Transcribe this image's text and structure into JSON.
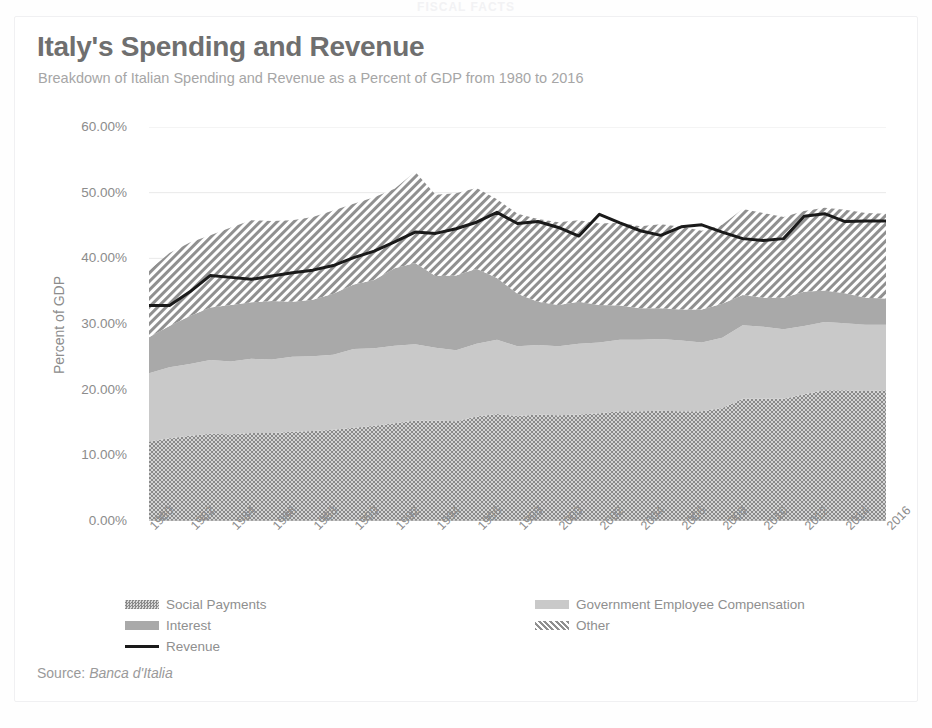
{
  "top_clip_text": "FISCAL FACTS",
  "card": {
    "title": "Italy's Spending and Revenue",
    "subtitle": "Breakdown of Italian Spending and Revenue as a Percent of GDP from 1980 to 2016",
    "source_prefix": "Source:",
    "source_name": "Banca d'Italia"
  },
  "legend": {
    "items": [
      {
        "label": "Social Payments",
        "marker": "pattern-dots-dark",
        "color": "#878787"
      },
      {
        "label": "Government Employee Compensation",
        "marker": "solid-lightgray",
        "color": "#c9c9c9"
      },
      {
        "label": "Interest",
        "marker": "solid-gray",
        "color": "#a9a9a9"
      },
      {
        "label": "Other",
        "marker": "pattern-diagonal",
        "color": "#9e9e9e"
      },
      {
        "label": "Revenue",
        "marker": "line-black",
        "color": "#1a1a1a"
      }
    ]
  },
  "chart_data": {
    "type": "area",
    "stacked": true,
    "title": "Italy's Spending and Revenue",
    "subtitle": "Breakdown of Italian Spending and Revenue as a Percent of GDP from 1980 to 2016",
    "xlabel": "",
    "ylabel": "Percent of GDP",
    "ylim": [
      0,
      60
    ],
    "ytick_labels": [
      "0.00%",
      "10.00%",
      "20.00%",
      "30.00%",
      "40.00%",
      "50.00%",
      "60.00%"
    ],
    "ytick_values": [
      0,
      10,
      20,
      30,
      40,
      50,
      60
    ],
    "grid": true,
    "legend_position": "bottom",
    "xlim": [
      1980,
      2016
    ],
    "xtick_labels": [
      "1980",
      "1982",
      "1984",
      "1986",
      "1988",
      "1990",
      "1992",
      "1994",
      "1996",
      "1998",
      "2000",
      "2002",
      "2004",
      "2006",
      "2008",
      "2010",
      "2012",
      "2014",
      "2016"
    ],
    "x": [
      1980,
      1981,
      1982,
      1983,
      1984,
      1985,
      1986,
      1987,
      1988,
      1989,
      1990,
      1991,
      1992,
      1993,
      1994,
      1995,
      1996,
      1997,
      1998,
      1999,
      2000,
      2001,
      2002,
      2003,
      2004,
      2005,
      2006,
      2007,
      2008,
      2009,
      2010,
      2011,
      2012,
      2013,
      2014,
      2015,
      2016
    ],
    "series": [
      {
        "name": "Social Payments",
        "color": "#878787",
        "values": [
          12.1,
          12.6,
          13.0,
          13.3,
          13.2,
          13.4,
          13.4,
          13.6,
          13.7,
          13.9,
          14.2,
          14.5,
          14.9,
          15.3,
          15.3,
          15.2,
          15.9,
          16.3,
          16.0,
          16.2,
          16.1,
          16.2,
          16.4,
          16.7,
          16.7,
          16.8,
          16.7,
          16.7,
          17.2,
          18.6,
          18.6,
          18.6,
          19.3,
          19.9,
          19.9,
          19.8,
          19.9
        ]
      },
      {
        "name": "Government Employee Compensation",
        "color": "#c9c9c9",
        "values": [
          10.4,
          10.8,
          10.9,
          11.2,
          11.1,
          11.3,
          11.2,
          11.4,
          11.4,
          11.4,
          12.0,
          11.8,
          11.8,
          11.6,
          11.1,
          10.8,
          11.1,
          11.3,
          10.6,
          10.6,
          10.5,
          10.8,
          10.8,
          10.9,
          10.9,
          10.9,
          10.8,
          10.5,
          10.7,
          11.2,
          11.0,
          10.6,
          10.4,
          10.4,
          10.2,
          10.1,
          10.0
        ]
      },
      {
        "name": "Interest",
        "color": "#a9a9a9",
        "values": [
          5.5,
          6.3,
          7.3,
          8.0,
          8.6,
          8.6,
          8.9,
          8.4,
          8.6,
          9.3,
          9.8,
          10.4,
          11.8,
          12.4,
          10.9,
          11.4,
          11.4,
          9.4,
          8.0,
          6.6,
          6.3,
          6.4,
          5.7,
          5.2,
          4.8,
          4.7,
          4.7,
          5.0,
          5.2,
          4.6,
          4.4,
          4.8,
          5.2,
          4.8,
          4.6,
          4.1,
          4.0
        ]
      },
      {
        "name": "Other",
        "color": "#9e9e9e",
        "values": [
          10.2,
          11.1,
          11.2,
          11.0,
          11.8,
          12.5,
          12.2,
          12.4,
          12.6,
          12.7,
          12.3,
          12.6,
          12.1,
          13.9,
          12.4,
          12.5,
          12.3,
          12.0,
          12.2,
          12.6,
          12.6,
          12.4,
          12.4,
          12.6,
          12.5,
          12.8,
          12.6,
          12.0,
          12.0,
          13.1,
          12.9,
          12.3,
          12.3,
          12.6,
          12.7,
          12.9,
          12.9
        ]
      }
    ],
    "line_series": [
      {
        "name": "Revenue",
        "color": "#1a1a1a",
        "values": [
          32.8,
          32.8,
          34.9,
          37.4,
          37.1,
          36.8,
          37.3,
          37.8,
          38.2,
          38.9,
          40.1,
          41.1,
          42.5,
          44.0,
          43.8,
          44.5,
          45.5,
          47.0,
          45.3,
          45.6,
          44.7,
          43.4,
          46.7,
          45.4,
          44.2,
          43.5,
          44.8,
          45.1,
          44.0,
          43.0,
          42.7,
          43.0,
          46.4,
          46.8,
          45.6,
          45.7,
          45.7
        ]
      }
    ]
  }
}
